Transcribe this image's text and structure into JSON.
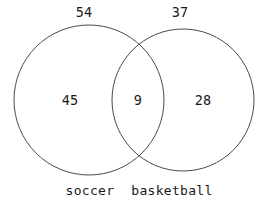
{
  "chart_data": {
    "type": "venn",
    "title": "",
    "sets": [
      {
        "name": "soccer",
        "total_label": "54",
        "total": 54,
        "only_label": "45",
        "only": 45,
        "circle": {
          "cx": 89,
          "cy": 100,
          "r": 75
        }
      },
      {
        "name": "basketball",
        "total_label": "37",
        "total": 37,
        "only_label": "28",
        "only": 28,
        "circle": {
          "cx": 183,
          "cy": 100,
          "r": 71
        }
      }
    ],
    "intersection_label": "9",
    "intersection": 9,
    "regions": [
      {
        "id": "soccer-only",
        "label": "45",
        "value": 45
      },
      {
        "id": "both",
        "label": "9",
        "value": 9
      },
      {
        "id": "basketball-only",
        "label": "28",
        "value": 28
      }
    ],
    "grid": false,
    "legend": "none",
    "colors": {
      "background": "#ffffff",
      "outline": "#4a4a4a",
      "text": "#1a1a1a"
    }
  },
  "diagram": {
    "left_total": "54",
    "right_total": "37",
    "left_only": "45",
    "both": "9",
    "right_only": "28",
    "left_name": "soccer",
    "right_name": "basketball"
  }
}
